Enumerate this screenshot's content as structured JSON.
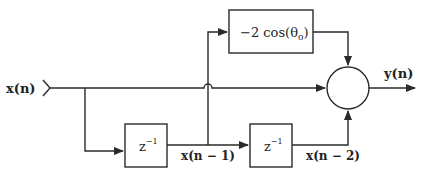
{
  "diagram": {
    "type": "signal-flow block diagram",
    "colors": {
      "line": "#2a2a2a",
      "background": "#ffffff"
    },
    "input": {
      "label": "x(n)"
    },
    "output": {
      "label": "y(n)"
    },
    "blocks": [
      {
        "id": "gain",
        "label_prefix": "−2 cos(θ",
        "label_sub": "o",
        "label_suffix": ")"
      },
      {
        "id": "delay1",
        "label_base": "z",
        "label_sup": "−1"
      },
      {
        "id": "delay2",
        "label_base": "z",
        "label_sup": "−1"
      }
    ],
    "signals": {
      "delay1_out": "x(n − 1)",
      "delay2_out": "x(n − 2)"
    },
    "summer": {
      "id": "sum",
      "symbol": ""
    }
  }
}
